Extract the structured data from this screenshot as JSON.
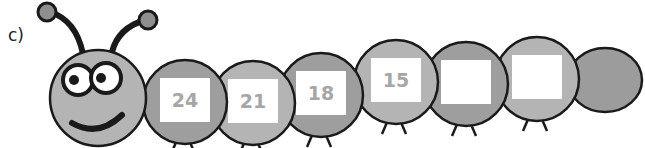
{
  "question_label": "c)",
  "caterpillar": {
    "description": "Caterpillar number sequence counting down by 3",
    "segments": [
      {
        "value": "24",
        "blank": false
      },
      {
        "value": "21",
        "blank": false
      },
      {
        "value": "18",
        "blank": false
      },
      {
        "value": "15",
        "blank": false
      },
      {
        "value": "",
        "blank": true
      },
      {
        "value": "",
        "blank": true
      }
    ]
  },
  "colors": {
    "body_light": "#b4b4b4",
    "body_dark": "#9e9e9e",
    "outline": "#1a1a1a",
    "number_text": "#a6a6a6",
    "box_fill": "#ffffff"
  }
}
